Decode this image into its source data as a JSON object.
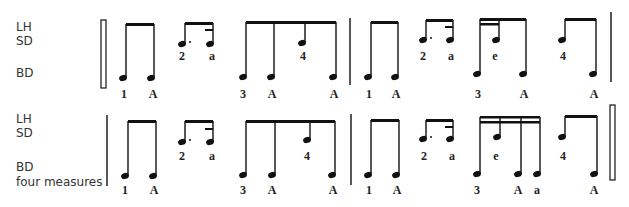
{
  "rows": [
    {
      "labels": {
        "lh": "LH",
        "sd": "SD",
        "bd": "BD",
        "extra": ""
      },
      "counts": [
        {
          "text": "1",
          "x": 124,
          "y": 88
        },
        {
          "text": "A",
          "x": 153,
          "y": 88
        },
        {
          "text": "2",
          "x": 182,
          "y": 50
        },
        {
          "text": "a",
          "x": 212,
          "y": 50
        },
        {
          "text": "3",
          "x": 243,
          "y": 88
        },
        {
          "text": "A",
          "x": 272,
          "y": 88
        },
        {
          "text": "4",
          "x": 303,
          "y": 50
        },
        {
          "text": "A",
          "x": 334,
          "y": 88
        },
        {
          "text": "1",
          "x": 369,
          "y": 88
        },
        {
          "text": "A",
          "x": 396,
          "y": 88
        },
        {
          "text": "2",
          "x": 423,
          "y": 50
        },
        {
          "text": "a",
          "x": 451,
          "y": 50
        },
        {
          "text": "3",
          "x": 478,
          "y": 88
        },
        {
          "text": "e",
          "x": 495,
          "y": 50
        },
        {
          "text": "A",
          "x": 524,
          "y": 88
        },
        {
          "text": "4",
          "x": 563,
          "y": 50
        },
        {
          "text": "A",
          "x": 594,
          "y": 88
        }
      ]
    },
    {
      "labels": {
        "lh": "LH",
        "sd": "SD",
        "bd": "BD",
        "extra": "four measures"
      },
      "counts": [
        {
          "text": "1",
          "x": 125,
          "y": 184
        },
        {
          "text": "A",
          "x": 154,
          "y": 184
        },
        {
          "text": "2",
          "x": 182,
          "y": 150
        },
        {
          "text": "a",
          "x": 212,
          "y": 150
        },
        {
          "text": "3",
          "x": 243,
          "y": 184
        },
        {
          "text": "A",
          "x": 272,
          "y": 184
        },
        {
          "text": "4",
          "x": 307,
          "y": 150
        },
        {
          "text": "A",
          "x": 333,
          "y": 184
        },
        {
          "text": "1",
          "x": 369,
          "y": 184
        },
        {
          "text": "A",
          "x": 397,
          "y": 184
        },
        {
          "text": "2",
          "x": 424,
          "y": 150
        },
        {
          "text": "a",
          "x": 452,
          "y": 150
        },
        {
          "text": "3",
          "x": 477,
          "y": 184
        },
        {
          "text": "e",
          "x": 496,
          "y": 150
        },
        {
          "text": "A",
          "x": 518,
          "y": 184
        },
        {
          "text": "a",
          "x": 537,
          "y": 184
        },
        {
          "text": "4",
          "x": 563,
          "y": 150
        },
        {
          "text": "A",
          "x": 594,
          "y": 184
        }
      ]
    }
  ]
}
